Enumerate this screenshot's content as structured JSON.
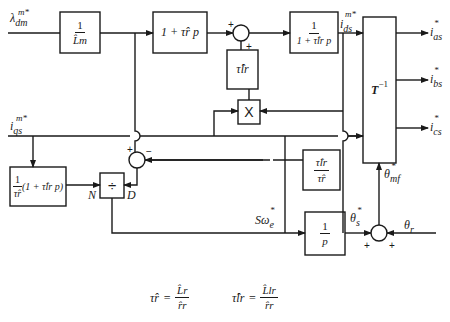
{
  "figure": {
    "type": "block-diagram",
    "inputs": {
      "lambda_dm": {
        "sym": "λ",
        "sub": "dm",
        "sup": "m*"
      },
      "i_qs": {
        "sym": "i",
        "sub": "qs",
        "sup": "m*"
      },
      "theta_r": {
        "sym": "θ",
        "sub": "r"
      }
    },
    "blocks": {
      "inv_Lm": {
        "num": "1",
        "den": "L̂m"
      },
      "lead_tau_r": {
        "text": "1 + τ̂r p"
      },
      "tau_lr": {
        "text": "τ̂lr"
      },
      "lag_tau_lr": {
        "num": "1",
        "den": "1 + τ̂lr p"
      },
      "T_inv": {
        "text": "T",
        "sup": "−1"
      },
      "mult": {
        "text": "X"
      },
      "ratio": {
        "num": "τ̂lr",
        "den": "τ̂r"
      },
      "slip_num": {
        "pre": "1",
        "pre_den": "τ̂r",
        "post": "(1 + τ̂lr p)"
      },
      "divide": {
        "text": "÷",
        "port_n": "N",
        "port_d": "D"
      },
      "integrator": {
        "num": "1",
        "den": "p"
      }
    },
    "signals": {
      "i_ds": {
        "sym": "i",
        "sub": "ds",
        "sup": "m*"
      },
      "slip": {
        "text": "Sω",
        "sub": "e",
        "sup": "*"
      },
      "theta_s": {
        "sym": "θ",
        "sub": "s",
        "sup": "*"
      },
      "theta_mf": {
        "sym": "θ",
        "sub": "mf",
        "sup": "*"
      }
    },
    "outputs": [
      {
        "sym": "i",
        "sub": "as",
        "sup": "*"
      },
      {
        "sym": "i",
        "sub": "bs",
        "sup": "*"
      },
      {
        "sym": "i",
        "sub": "cs",
        "sup": "*"
      }
    ],
    "summers": {
      "sum1_signs": [
        "+",
        "+"
      ],
      "sum2_signs": [
        "+",
        "−"
      ],
      "sum3_signs": [
        "+",
        "+"
      ]
    },
    "definitions": {
      "tau_r": {
        "lhs": "τ̂r",
        "num": "L̂r",
        "den": "r̂r"
      },
      "tau_lr": {
        "lhs": "τ̂lr",
        "num": "L̂lr",
        "den": "r̂r"
      }
    }
  }
}
